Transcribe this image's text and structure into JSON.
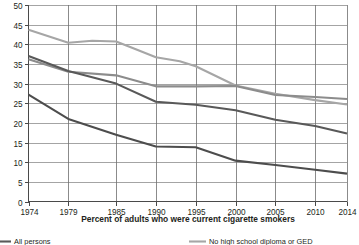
{
  "chart_data": {
    "type": "line",
    "title": "",
    "xlabel": "Percent of adults who were current cigarette smokers",
    "ylabel": "",
    "xlim": [
      1974,
      2014
    ],
    "ylim": [
      0,
      50
    ],
    "grid": true,
    "legend_position": "bottom",
    "x": [
      1974,
      1979,
      1985,
      1990,
      1995,
      2000,
      2005,
      2010,
      2014
    ],
    "xtick_labels": [
      "1974",
      "1979",
      "1985",
      "1990",
      "1995",
      "2000",
      "2005",
      "2010",
      "2014"
    ],
    "ytick_labels": [
      "0",
      "5",
      "10",
      "15",
      "20",
      "25",
      "30",
      "35",
      "40",
      "45",
      "50"
    ],
    "ytick_values": [
      0,
      5,
      10,
      15,
      20,
      25,
      30,
      35,
      40,
      45,
      50
    ],
    "series": [
      {
        "name": "No high school diploma or GED",
        "color": "#a6a6a6",
        "values": [
          43.7,
          40.4,
          40.9,
          36.7,
          34.4,
          29.5,
          27.4,
          25.8,
          24.7
        ]
      },
      {
        "name": "High school diploma or GED",
        "color": "#8c8c8c",
        "values": [
          36.2,
          33.0,
          32.1,
          29.3,
          29.3,
          29.4,
          27.1,
          26.6,
          26.1
        ]
      },
      {
        "name": "All persons",
        "color": "#595959",
        "values": [
          37.0,
          33.2,
          30.0,
          25.4,
          24.6,
          23.2,
          20.8,
          19.2,
          17.3
        ]
      },
      {
        "name": "Undergraduate or graduate degree",
        "color": "#4d4d4d",
        "values": [
          27.2,
          21.0,
          17.0,
          14.0,
          13.8,
          10.4,
          9.3,
          8.1,
          7.1
        ]
      }
    ],
    "series_detailed": [
      {
        "name": "No high school diploma or GED",
        "points": [
          {
            "x": 1974,
            "y": 43.7
          },
          {
            "x": 1979,
            "y": 40.4
          },
          {
            "x": 1982,
            "y": 40.9
          },
          {
            "x": 1985,
            "y": 40.7
          },
          {
            "x": 1987,
            "y": 39.1
          },
          {
            "x": 1990,
            "y": 36.7
          },
          {
            "x": 1993,
            "y": 35.7
          },
          {
            "x": 1995,
            "y": 34.4
          },
          {
            "x": 2000,
            "y": 29.5
          },
          {
            "x": 2005,
            "y": 27.4
          },
          {
            "x": 2010,
            "y": 25.8
          },
          {
            "x": 2014,
            "y": 24.7
          }
        ]
      },
      {
        "name": "High school diploma or GED",
        "points": [
          {
            "x": 1974,
            "y": 36.2
          },
          {
            "x": 1979,
            "y": 33.0
          },
          {
            "x": 1985,
            "y": 32.1
          },
          {
            "x": 1990,
            "y": 29.3
          },
          {
            "x": 1995,
            "y": 29.3
          },
          {
            "x": 2000,
            "y": 29.4
          },
          {
            "x": 2005,
            "y": 27.1
          },
          {
            "x": 2010,
            "y": 26.6
          },
          {
            "x": 2014,
            "y": 26.1
          }
        ]
      },
      {
        "name": "All persons",
        "points": [
          {
            "x": 1974,
            "y": 37.0
          },
          {
            "x": 1979,
            "y": 33.2
          },
          {
            "x": 1985,
            "y": 30.0
          },
          {
            "x": 1990,
            "y": 25.4
          },
          {
            "x": 1995,
            "y": 24.6
          },
          {
            "x": 2000,
            "y": 23.2
          },
          {
            "x": 2005,
            "y": 20.8
          },
          {
            "x": 2010,
            "y": 19.2
          },
          {
            "x": 2014,
            "y": 17.3
          }
        ]
      },
      {
        "name": "Undergraduate or graduate degree",
        "points": [
          {
            "x": 1974,
            "y": 27.2
          },
          {
            "x": 1979,
            "y": 21.0
          },
          {
            "x": 1985,
            "y": 17.0
          },
          {
            "x": 1990,
            "y": 14.0
          },
          {
            "x": 1995,
            "y": 13.8
          },
          {
            "x": 2000,
            "y": 10.4
          },
          {
            "x": 2005,
            "y": 9.3
          },
          {
            "x": 2010,
            "y": 8.1
          },
          {
            "x": 2014,
            "y": 7.1
          }
        ]
      }
    ]
  },
  "legend": {
    "left_label": "All persons",
    "right_label": "No high school diploma or GED"
  },
  "colors": {
    "axis": "#4a4a4a",
    "grid": "#7d7d7d",
    "text": "#231f20",
    "series_1": "#a6a6a6",
    "series_2": "#8c8c8c",
    "series_3": "#595959",
    "series_4": "#4d4d4d"
  }
}
